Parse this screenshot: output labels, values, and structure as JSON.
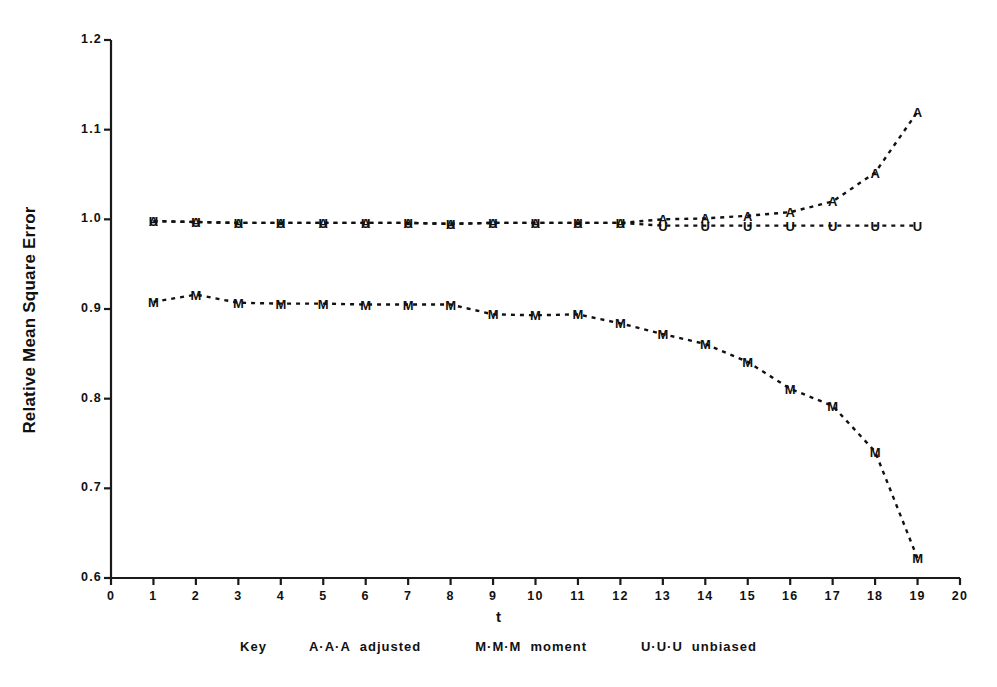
{
  "chart_data": {
    "type": "line",
    "title": "",
    "xlabel": "t",
    "ylabel": "Relative Mean Square Error",
    "xlim": [
      0,
      20
    ],
    "ylim": [
      0.6,
      1.2
    ],
    "grid": false,
    "legend_position": "below-plot",
    "legend_prefix": "Key",
    "x_ticks": [
      "0",
      "1",
      "2",
      "3",
      "4",
      "5",
      "6",
      "7",
      "8",
      "9",
      "10",
      "11",
      "12",
      "13",
      "14",
      "15",
      "16",
      "17",
      "18",
      "19",
      "20"
    ],
    "y_ticks": [
      "0.6",
      "0.7",
      "0.8",
      "0.9",
      "1.0",
      "1.1",
      "1.2"
    ],
    "x": [
      1,
      2,
      3,
      4,
      5,
      6,
      7,
      8,
      9,
      10,
      11,
      12,
      13,
      14,
      15,
      16,
      17,
      18,
      19
    ],
    "series": [
      {
        "name": "adjusted",
        "marker": "A",
        "legend_symbol": "A·A·A",
        "color": "#111111",
        "values": [
          0.998,
          0.997,
          0.996,
          0.996,
          0.996,
          0.996,
          0.996,
          0.995,
          0.996,
          0.996,
          0.996,
          0.996,
          1.0,
          1.001,
          1.004,
          1.008,
          1.02,
          1.052,
          1.12
        ]
      },
      {
        "name": "moment",
        "marker": "M",
        "legend_symbol": "M·M·M",
        "color": "#111111",
        "values": [
          0.908,
          0.916,
          0.907,
          0.906,
          0.906,
          0.905,
          0.905,
          0.905,
          0.894,
          0.893,
          0.894,
          0.884,
          0.872,
          0.861,
          0.841,
          0.811,
          0.792,
          0.741,
          0.622
        ]
      },
      {
        "name": "unbiased",
        "marker": "U",
        "legend_symbol": "U·U·U",
        "color": "#111111",
        "values": [
          0.998,
          0.997,
          0.996,
          0.996,
          0.996,
          0.996,
          0.996,
          0.995,
          0.996,
          0.996,
          0.996,
          0.996,
          0.993,
          0.993,
          0.993,
          0.993,
          0.993,
          0.993,
          0.993
        ]
      }
    ]
  }
}
